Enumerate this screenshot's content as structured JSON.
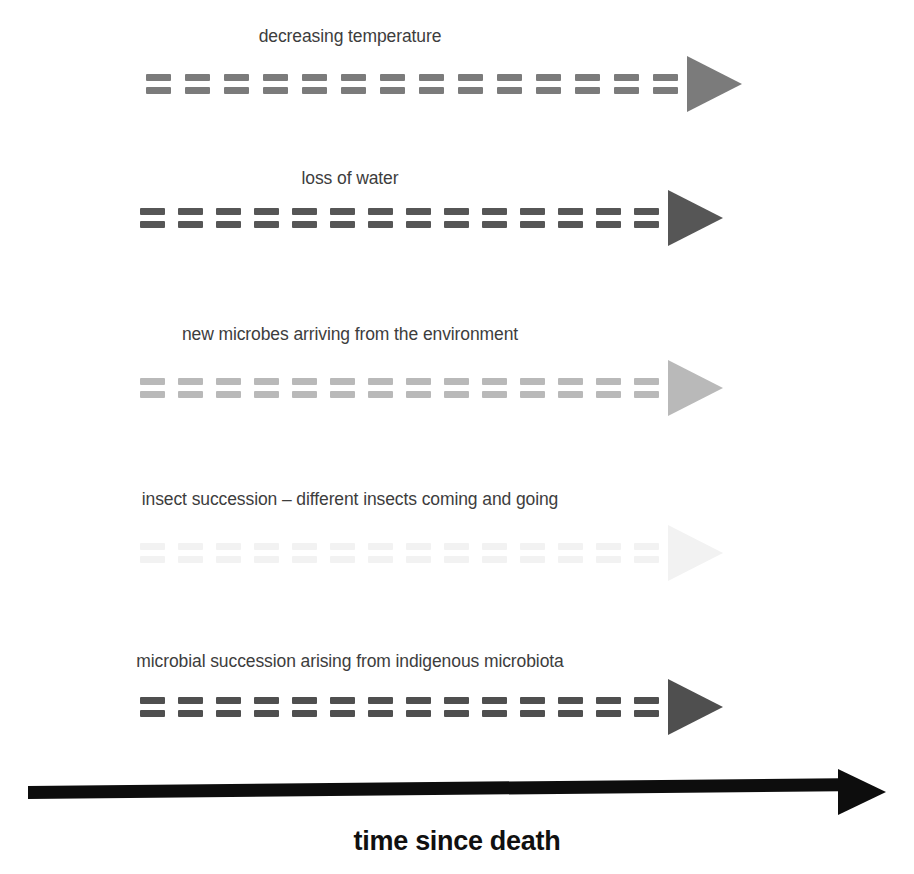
{
  "figure": {
    "type": "timeline-diagram",
    "title_caption": "time since death",
    "background_color": "#ffffff",
    "mark_symbol": "equals-sign",
    "marks_per_row": 14
  },
  "processes": [
    {
      "label": "decreasing temperature",
      "color": "#7b7b7b",
      "label_color": "#3d3d3d",
      "top": 26,
      "track_top": 62,
      "track_left": 146,
      "track_width": 543,
      "mark_gap": 14
    },
    {
      "label": "loss of water",
      "color": "#565656",
      "label_color": "#3d3d3d",
      "top": 168,
      "track_top": 196,
      "track_left": 140,
      "track_width": 549,
      "mark_gap": 13
    },
    {
      "label": "new microbes arriving from the environment",
      "color": "#b9b9b9",
      "label_color": "#3d3d3d",
      "top": 324,
      "track_top": 366,
      "track_left": 140,
      "track_width": 549,
      "mark_gap": 13
    },
    {
      "label": "insect succession – different insects coming and going",
      "color": "#f2f2f2",
      "label_color": "#3d3d3d",
      "top": 489,
      "track_top": 531,
      "track_left": 140,
      "track_width": 549,
      "mark_gap": 13
    },
    {
      "label": "microbial succession arising from indigenous microbiota",
      "color": "#4f4f4f",
      "label_color": "#3d3d3d",
      "top": 651,
      "track_top": 685,
      "track_left": 140,
      "track_width": 549,
      "mark_gap": 13
    }
  ],
  "timeline": {
    "caption": "time since death",
    "color": "#0d0d0d"
  },
  "chart_data": {
    "type": "timeline",
    "xlabel": "time since death",
    "axis": "single horizontal time axis, direction left to right, no tick labels",
    "series": [
      {
        "name": "decreasing temperature",
        "intensity": "medium",
        "shade_hex": "#7b7b7b"
      },
      {
        "name": "loss of water",
        "intensity": "dark",
        "shade_hex": "#565656"
      },
      {
        "name": "new microbes arriving from the environment",
        "intensity": "light",
        "shade_hex": "#b9b9b9"
      },
      {
        "name": "insect succession – different insects coming and going",
        "intensity": "very faint",
        "shade_hex": "#f2f2f2"
      },
      {
        "name": "microbial succession arising from indigenous microbiota",
        "intensity": "dark",
        "shade_hex": "#4f4f4f"
      }
    ],
    "legend": "none",
    "grid": false
  }
}
